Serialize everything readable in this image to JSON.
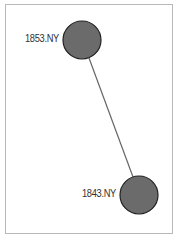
{
  "graph": {
    "nodes": [
      {
        "id": "1853.NY",
        "label": "1853.NY",
        "cx": 82,
        "cy": 40,
        "r": 19
      },
      {
        "id": "1843.NY",
        "label": "1843.NY",
        "cx": 139,
        "cy": 195,
        "r": 19
      }
    ],
    "edges": [
      {
        "source": "1853.NY",
        "target": "1843.NY"
      }
    ],
    "colors": {
      "node_fill": "#6b6b6b",
      "node_stroke": "#222222",
      "edge": "#666666",
      "border": "#b8b8b8"
    }
  }
}
